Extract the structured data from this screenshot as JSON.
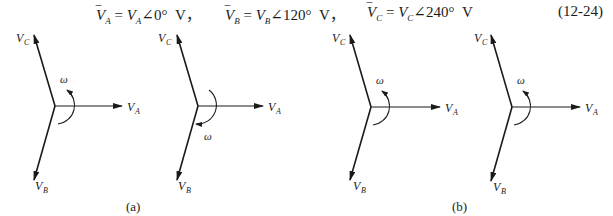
{
  "equation": {
    "parts": [
      {
        "name": "VA",
        "text": "V̅A = VA∠0°  V"
      },
      {
        "name": "VB",
        "text": "V̅B = VB∠120°  V"
      },
      {
        "name": "VC",
        "text": "V̅C = VC∠240°  V"
      }
    ],
    "separator": "，",
    "number": "(12-24)"
  },
  "diagrams": [
    {
      "id": "a1",
      "omega_direction": "counterclockwise",
      "labels": {
        "A": "V",
        "B": "V",
        "C": "V",
        "sub_A": "A",
        "sub_B": "B",
        "sub_C": "C",
        "omega": "ω"
      }
    },
    {
      "id": "a2",
      "omega_direction": "clockwise",
      "labels": {
        "A": "V",
        "B": "V",
        "C": "V",
        "sub_A": "A",
        "sub_B": "B",
        "sub_C": "C",
        "omega": "ω"
      }
    },
    {
      "id": "b1",
      "omega_direction": "counterclockwise",
      "labels": {
        "A": "V",
        "B": "V",
        "C": "V",
        "sub_A": "A",
        "sub_B": "B",
        "sub_C": "C",
        "omega": "ω"
      }
    },
    {
      "id": "b2",
      "omega_direction": "counterclockwise",
      "labels": {
        "A": "V",
        "B": "V",
        "C": "V",
        "sub_A": "A",
        "sub_B": "B",
        "sub_C": "C",
        "omega": "ω"
      }
    }
  ],
  "captions": {
    "a": "(a)",
    "b": "(b)"
  }
}
